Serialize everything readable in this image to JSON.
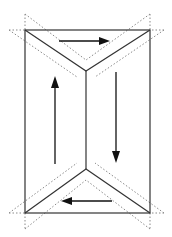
{
  "diagram": {
    "title": "",
    "colors": {
      "solid_line": "#333333",
      "dotted_line": "#8a8a8a",
      "arrow": "#111111",
      "background": "#ffffff"
    },
    "shape": "rectangle with V-shaped creases at top and bottom joined by central vertical line",
    "rectangle": {
      "x1": 25,
      "y1": 30,
      "x2": 150,
      "y2": 213
    },
    "top_apex": {
      "x": 86,
      "y": 71
    },
    "bottom_apex": {
      "x": 86,
      "y": 169
    },
    "arrows": [
      {
        "name": "top-arrow",
        "direction": "right",
        "from": [
          59,
          41
        ],
        "to": [
          110,
          41
        ]
      },
      {
        "name": "left-arrow",
        "direction": "up",
        "from": [
          55,
          164
        ],
        "to": [
          55,
          76
        ]
      },
      {
        "name": "right-arrow",
        "direction": "down",
        "from": [
          116,
          72
        ],
        "to": [
          116,
          163
        ]
      },
      {
        "name": "bottom-arrow",
        "direction": "left",
        "from": [
          112,
          201
        ],
        "to": [
          61,
          201
        ]
      }
    ],
    "dotted_guides": "parallel offset lines on both sides of each diagonal crease, extending beyond rectangle corners"
  }
}
